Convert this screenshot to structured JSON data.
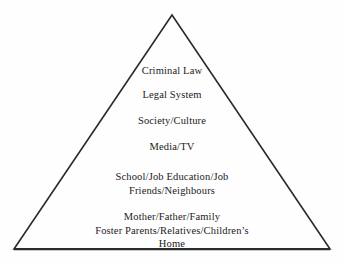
{
  "figure": {
    "shape": "triangle",
    "shape_name": "pyramid-diagram",
    "line_color": "#2b2b2b",
    "text_color": "#1b1b1b",
    "background_color": "#fefefe",
    "apex": {
      "x": 172,
      "y": 15
    },
    "base_left": {
      "x": 14,
      "y": 249
    },
    "base_right": {
      "x": 330,
      "y": 249
    }
  },
  "layers": [
    {
      "lines": [
        "Criminal Law"
      ]
    },
    {
      "lines": [
        "Legal System"
      ]
    },
    {
      "lines": [
        "Society/Culture"
      ]
    },
    {
      "lines": [
        "Media/TV"
      ]
    },
    {
      "lines": [
        "School/Job Education/Job",
        "Friends/Neighbours"
      ]
    },
    {
      "lines": [
        "Mother/Father/Family",
        "Foster Parents/Relatives/Children’s",
        "Home"
      ]
    }
  ]
}
